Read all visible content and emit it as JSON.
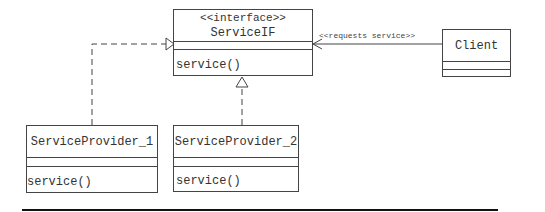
{
  "diagram": {
    "type": "UML class diagram",
    "classes": {
      "service_if": {
        "stereotype": "<<interface>>",
        "name": "ServiceIF",
        "attributes": [],
        "operations": [
          "service()"
        ]
      },
      "client": {
        "name": "Client",
        "attributes": [],
        "operations": []
      },
      "provider_1": {
        "name": "ServiceProvider_1",
        "attributes": [],
        "operations": [
          "service()"
        ]
      },
      "provider_2": {
        "name": "ServiceProvider_2",
        "attributes": [],
        "operations": [
          "service()"
        ]
      }
    },
    "relationships": [
      {
        "from": "ServiceProvider_1",
        "to": "ServiceIF",
        "kind": "realization"
      },
      {
        "from": "ServiceProvider_2",
        "to": "ServiceIF",
        "kind": "realization"
      },
      {
        "from": "Client",
        "to": "ServiceIF",
        "kind": "dependency",
        "label": "<<requests service>>"
      }
    ],
    "colors": {
      "line": "#444444",
      "text": "#333333",
      "rule": "#111111"
    }
  }
}
